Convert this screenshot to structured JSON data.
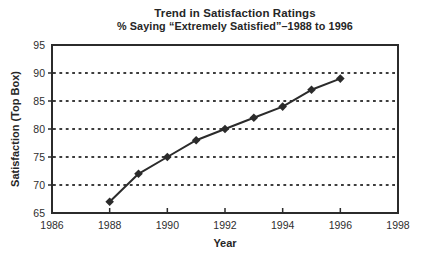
{
  "chart_data": {
    "type": "line",
    "title": "Trend in Satisfaction Ratings",
    "subtitle": "% Saying “Extremely Satisfied”–1988 to 1996",
    "xlabel": "Year",
    "ylabel": "Satisfaction (Top Box)",
    "x": [
      1988,
      1989,
      1990,
      1991,
      1992,
      1993,
      1994,
      1995,
      1996
    ],
    "values": [
      67,
      72,
      75,
      78,
      80,
      82,
      84,
      87,
      89
    ],
    "series_name": "% Extremely Satisfied",
    "xlim": [
      1986,
      1998
    ],
    "ylim": [
      65,
      95
    ],
    "x_ticks": [
      1986,
      1988,
      1990,
      1992,
      1994,
      1996,
      1998
    ],
    "y_ticks": [
      65,
      70,
      75,
      80,
      85,
      90,
      95
    ],
    "gridlines_y": [
      70,
      75,
      80,
      85,
      90
    ],
    "grid_style": "dashed-horizontal",
    "legend": "none",
    "marker": "diamond",
    "line_color": "#2b2b2b",
    "axis_color": "#2b2b2b",
    "grid_color": "#3d3d3d",
    "text_color": "#2e2e2e"
  }
}
